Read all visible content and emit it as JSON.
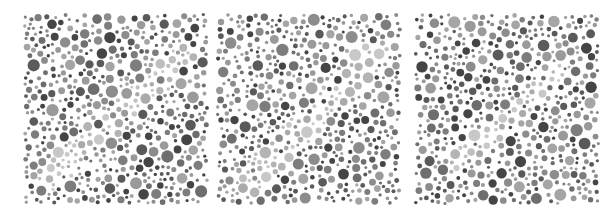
{
  "canvas": {
    "width": 615,
    "height": 216,
    "background": "#ffffff"
  },
  "plates": [
    {
      "id": "plate-1",
      "x": 23,
      "y": 13,
      "width": 186,
      "height": 192,
      "seed": 11,
      "hidden_figure": {
        "shape": "diagonal-band",
        "from": [
          0.15,
          0.85
        ],
        "to": [
          0.85,
          0.25
        ],
        "width": 0.14
      }
    },
    {
      "id": "plate-2",
      "x": 216,
      "y": 13,
      "width": 186,
      "height": 192,
      "seed": 29,
      "hidden_figure": {
        "shape": "diagonal-band",
        "from": [
          0.18,
          0.88
        ],
        "to": [
          0.85,
          0.22
        ],
        "width": 0.16
      }
    },
    {
      "id": "plate-3",
      "x": 414,
      "y": 13,
      "width": 186,
      "height": 192,
      "seed": 47,
      "hidden_figure": {
        "shape": "diagonal-band",
        "from": [
          0.2,
          0.8
        ],
        "to": [
          0.8,
          0.3
        ],
        "width": 0.12
      }
    }
  ],
  "dot_palette": {
    "background_dots": [
      "#5a5a5a",
      "#6e6e6e",
      "#7d7d7d",
      "#8c8c8c",
      "#9a9a9a",
      "#454545",
      "#a5a5a5"
    ],
    "figure_dots": [
      "#b4b4b4",
      "#bfbfbf",
      "#c8c8c8",
      "#aaaaaa"
    ]
  },
  "dot_size_range": [
    1.5,
    6.2
  ]
}
